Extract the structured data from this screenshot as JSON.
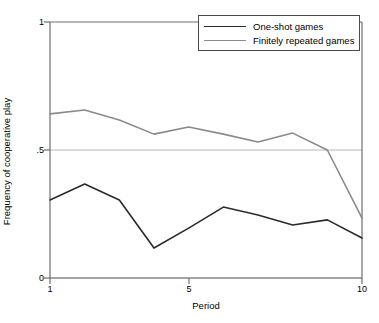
{
  "chart_data": {
    "type": "line",
    "title": "",
    "xlabel": "Period",
    "ylabel": "Frequency of cooperative play",
    "x": [
      1,
      2,
      3,
      4,
      5,
      6,
      7,
      8,
      9,
      10
    ],
    "xlim": [
      1,
      10
    ],
    "ylim": [
      0,
      1
    ],
    "xticks": [
      1,
      5,
      10
    ],
    "xtick_labels": [
      "1",
      "5",
      "10"
    ],
    "yticks": [
      0,
      0.5,
      1
    ],
    "ytick_labels": [
      "0",
      ".5",
      "1"
    ],
    "grid": "horizontal-gridlines-at-0-and-.5",
    "legend_position": "top-right-inside",
    "series": [
      {
        "name": "One-shot games",
        "color": "#2b2b2b",
        "values": [
          0.305,
          0.367,
          0.305,
          0.117,
          0.195,
          0.277,
          0.246,
          0.207,
          0.227,
          0.156
        ]
      },
      {
        "name": "Finitely repeated games",
        "color": "#8a8a8a",
        "values": [
          0.641,
          0.656,
          0.617,
          0.562,
          0.59,
          0.562,
          0.531,
          0.566,
          0.5,
          0.234
        ]
      }
    ]
  },
  "axes": {
    "y_title": "Frequency of cooperative play",
    "x_title": "Period",
    "y_tick_labels": [
      "0",
      ".5",
      "1"
    ],
    "x_tick_labels": [
      "1",
      "5",
      "10"
    ]
  },
  "legend": {
    "items": [
      {
        "label": "One-shot games"
      },
      {
        "label": "Finitely repeated games"
      }
    ]
  },
  "colors": {
    "one_shot": "#2b2b2b",
    "finitely_repeated": "#8a8a8a",
    "axis": "#6e6e6e",
    "gridline": "#b8b8b8"
  }
}
